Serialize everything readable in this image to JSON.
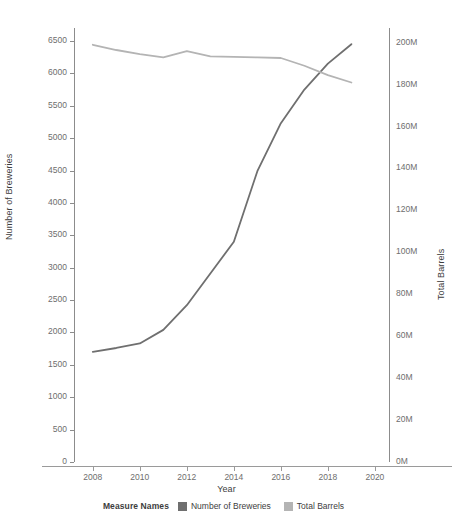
{
  "chart_data": {
    "type": "line",
    "title": "",
    "xlabel": "Year",
    "x": [
      2008,
      2009,
      2010,
      2011,
      2012,
      2013,
      2014,
      2015,
      2016,
      2017,
      2018,
      2019
    ],
    "xlim": [
      2007.2,
      2020.6
    ],
    "xticks": [
      2008,
      2010,
      2012,
      2014,
      2016,
      2018,
      2020
    ],
    "xticklabels": [
      "2008",
      "2010",
      "2012",
      "2014",
      "2016",
      "2018",
      "2020"
    ],
    "grid": false,
    "legend_position": "bottom",
    "legend_title": "Measure Names",
    "axes": [
      {
        "id": "left",
        "label": "Number of Breweries",
        "ylim": [
          0,
          6700
        ],
        "yticks": [
          0,
          500,
          1000,
          1500,
          2000,
          2500,
          3000,
          3500,
          4000,
          4500,
          5000,
          5500,
          6000,
          6500
        ],
        "yticklabels": [
          "0",
          "500",
          "1000",
          "1500",
          "2000",
          "2500",
          "3000",
          "3500",
          "4000",
          "4500",
          "5000",
          "5500",
          "6000",
          "6500"
        ]
      },
      {
        "id": "right",
        "label": "Total Barrels",
        "ylim": [
          0,
          207000000
        ],
        "yticks": [
          0,
          20000000,
          40000000,
          60000000,
          80000000,
          100000000,
          120000000,
          140000000,
          160000000,
          180000000,
          200000000
        ],
        "yticklabels": [
          "0M",
          "20M",
          "40M",
          "60M",
          "80M",
          "100M",
          "120M",
          "140M",
          "160M",
          "180M",
          "200M"
        ]
      }
    ],
    "series": [
      {
        "name": "Number of Breweries",
        "axis": "left",
        "color": "#6f6f6f",
        "values": [
          1700,
          1760,
          1830,
          2040,
          2420,
          2910,
          3400,
          4490,
          5230,
          5750,
          6150,
          6450
        ]
      },
      {
        "name": "Total Barrels",
        "axis": "right",
        "color": "#b4b4b4",
        "values": [
          199000000,
          196500000,
          194500000,
          193000000,
          196000000,
          193500000,
          193200000,
          193000000,
          192700000,
          189000000,
          184500000,
          181000000
        ]
      }
    ]
  },
  "axis_titles": {
    "left": "Number of Breweries",
    "right": "Total Barrels",
    "bottom": "Year"
  },
  "legend": {
    "title": "Measure Names",
    "entries": [
      {
        "label": "Number of Breweries",
        "color": "#6f6f6f"
      },
      {
        "label": "Total Barrels",
        "color": "#b4b4b4"
      }
    ]
  },
  "colors": {
    "breweries_line": "#6f6f6f",
    "barrels_line": "#b4b4b4",
    "axis_line": "#9a9a9a",
    "tick_text": "#6e6e6e",
    "title_text": "#3d3d3d",
    "background": "#ffffff"
  }
}
